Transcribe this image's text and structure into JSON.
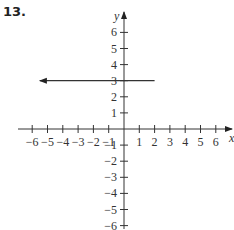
{
  "problem": {
    "number": "13."
  },
  "chart_data": {
    "type": "line",
    "title": "",
    "xlabel": "x",
    "ylabel": "y",
    "xlim": [
      -6,
      6
    ],
    "ylim": [
      -6,
      6
    ],
    "x_ticks": [
      -6,
      -5,
      -4,
      -3,
      -2,
      -1,
      1,
      2,
      3,
      4,
      5,
      6
    ],
    "y_ticks": [
      -6,
      -5,
      -4,
      -3,
      -2,
      -1,
      1,
      2,
      3,
      4,
      5,
      6
    ],
    "x_tick_labels": [
      "−6",
      "−5",
      "−4",
      "−3",
      "−2",
      "−1",
      "1",
      "2",
      "3",
      "4",
      "5",
      "6"
    ],
    "y_tick_labels": [
      "−6",
      "−5",
      "−4",
      "−3",
      "−2",
      "−1",
      "1",
      "2",
      "3",
      "4",
      "5",
      "6"
    ],
    "grid": false,
    "series": [
      {
        "name": "ray y = 3",
        "kind": "ray",
        "y": 3,
        "x_start": 2,
        "direction": "left",
        "x_end_visible": -5.5,
        "arrow": "left",
        "color": "#333333"
      }
    ]
  }
}
